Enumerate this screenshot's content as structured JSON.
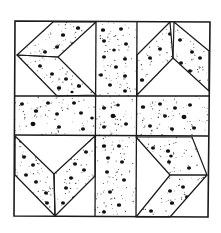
{
  "figure": {
    "width": 221,
    "height": 233,
    "colors": {
      "background": "#ffffff",
      "line": "#1a1a1a",
      "dot": "#111111",
      "speck": "#444444"
    }
  },
  "outer_square": [
    [
      15,
      21
    ],
    [
      210,
      22
    ],
    [
      208,
      217
    ],
    [
      14,
      216
    ]
  ],
  "grid_lines": [
    {
      "name": "vertical-left",
      "points": [
        [
          96,
          21
        ],
        [
          95,
          216
        ]
      ]
    },
    {
      "name": "vertical-right",
      "points": [
        [
          137,
          22
        ],
        [
          136,
          217
        ]
      ]
    },
    {
      "name": "horizontal-top",
      "points": [
        [
          15,
          96
        ],
        [
          209,
          96
        ]
      ]
    },
    {
      "name": "horizontal-bottom",
      "points": [
        [
          14,
          135
        ],
        [
          208,
          136
        ]
      ]
    }
  ],
  "speckled_areas": [
    {
      "name": "center-column-top",
      "points": [
        [
          96,
          21
        ],
        [
          137,
          22
        ],
        [
          137,
          96
        ],
        [
          96,
          96
        ]
      ]
    },
    {
      "name": "center-row",
      "points": [
        [
          15,
          96
        ],
        [
          209,
          96
        ],
        [
          208,
          136
        ],
        [
          14,
          135
        ]
      ]
    },
    {
      "name": "center-column-bottom",
      "points": [
        [
          96,
          135
        ],
        [
          136,
          136
        ],
        [
          136,
          217
        ],
        [
          95,
          216
        ]
      ]
    }
  ],
  "chevron_pieces": [
    {
      "name": "top-left-upper",
      "block": "top-left",
      "points": [
        [
          53,
          22
        ],
        [
          96,
          22
        ],
        [
          58,
          57
        ],
        [
          17,
          55
        ]
      ]
    },
    {
      "name": "top-left-lower",
      "block": "top-left",
      "points": [
        [
          17,
          55
        ],
        [
          58,
          57
        ],
        [
          96,
          95
        ],
        [
          57,
          96
        ]
      ]
    },
    {
      "name": "top-right-left",
      "block": "top-right",
      "points": [
        [
          170,
          22
        ],
        [
          173,
          58
        ],
        [
          137,
          95
        ],
        [
          137,
          55
        ]
      ]
    },
    {
      "name": "top-right-right",
      "block": "top-right",
      "points": [
        [
          174,
          22
        ],
        [
          209,
          51
        ],
        [
          209,
          91
        ],
        [
          173,
          58
        ]
      ]
    },
    {
      "name": "bottom-left-left",
      "block": "bottom-left",
      "points": [
        [
          15,
          136
        ],
        [
          54,
          174
        ],
        [
          55,
          216
        ],
        [
          15,
          175
        ]
      ]
    },
    {
      "name": "bottom-left-right",
      "block": "bottom-left",
      "points": [
        [
          95,
          136
        ],
        [
          95,
          176
        ],
        [
          55,
          216
        ],
        [
          54,
          174
        ]
      ]
    },
    {
      "name": "bottom-right-upper",
      "block": "bottom-right",
      "points": [
        [
          136,
          137
        ],
        [
          192,
          137
        ],
        [
          207,
          175
        ],
        [
          170,
          175
        ]
      ]
    },
    {
      "name": "bottom-right-lower",
      "block": "bottom-right",
      "points": [
        [
          170,
          175
        ],
        [
          207,
          175
        ],
        [
          170,
          217
        ],
        [
          136,
          217
        ]
      ]
    }
  ],
  "dots": [
    [
      63,
      35,
      2.2
    ],
    [
      78,
      28,
      2.2
    ],
    [
      57,
      47,
      2.0
    ],
    [
      73,
      44,
      2.0
    ],
    [
      86,
      33,
      2.0
    ],
    [
      45,
      52,
      2.0
    ],
    [
      69,
      55,
      1.8
    ],
    [
      40,
      66,
      2.0
    ],
    [
      52,
      74,
      2.0
    ],
    [
      66,
      79,
      2.0
    ],
    [
      79,
      86,
      2.2
    ],
    [
      59,
      88,
      2.2
    ],
    [
      72,
      92,
      1.6
    ],
    [
      103,
      30,
      2.2
    ],
    [
      121,
      29,
      2.0
    ],
    [
      104,
      41,
      2.0
    ],
    [
      126,
      44,
      2.0
    ],
    [
      114,
      50,
      1.8
    ],
    [
      104,
      57,
      2.0
    ],
    [
      125,
      59,
      2.0
    ],
    [
      116,
      67,
      2.0
    ],
    [
      101,
      75,
      2.0
    ],
    [
      125,
      76,
      2.0
    ],
    [
      110,
      85,
      2.0
    ],
    [
      125,
      91,
      2.0
    ],
    [
      170,
      34,
      2.0
    ],
    [
      160,
      49,
      2.0
    ],
    [
      150,
      58,
      2.0
    ],
    [
      142,
      80,
      2.2
    ],
    [
      155,
      88,
      2.0
    ],
    [
      180,
      40,
      2.0
    ],
    [
      192,
      52,
      2.0
    ],
    [
      181,
      63,
      2.0
    ],
    [
      200,
      58,
      2.0
    ],
    [
      190,
      71,
      2.0
    ],
    [
      200,
      88,
      2.2
    ],
    [
      36,
      111,
      2.2
    ],
    [
      22,
      104,
      2.0
    ],
    [
      48,
      103,
      2.0
    ],
    [
      57,
      114,
      2.0
    ],
    [
      74,
      103,
      2.0
    ],
    [
      81,
      113,
      2.0
    ],
    [
      92,
      118,
      1.8
    ],
    [
      33,
      124,
      2.5
    ],
    [
      59,
      127,
      2.0
    ],
    [
      83,
      129,
      2.0
    ],
    [
      104,
      108,
      2.0
    ],
    [
      118,
      105,
      1.8
    ],
    [
      113,
      116,
      2.5
    ],
    [
      104,
      127,
      2.0
    ],
    [
      126,
      124,
      2.0
    ],
    [
      143,
      107,
      2.2
    ],
    [
      160,
      104,
      2.0
    ],
    [
      175,
      108,
      2.0
    ],
    [
      190,
      105,
      2.0
    ],
    [
      165,
      116,
      2.0
    ],
    [
      184,
      117,
      2.5
    ],
    [
      150,
      126,
      2.0
    ],
    [
      172,
      129,
      2.0
    ],
    [
      194,
      128,
      2.0
    ],
    [
      21,
      141,
      2.0
    ],
    [
      24,
      157,
      2.0
    ],
    [
      33,
      165,
      2.0
    ],
    [
      26,
      175,
      2.0
    ],
    [
      36,
      182,
      2.0
    ],
    [
      46,
      193,
      2.0
    ],
    [
      47,
      203,
      2.0
    ],
    [
      89,
      140,
      2.0
    ],
    [
      86,
      152,
      2.0
    ],
    [
      75,
      164,
      2.0
    ],
    [
      84,
      170,
      2.0
    ],
    [
      71,
      178,
      2.0
    ],
    [
      66,
      188,
      2.0
    ],
    [
      74,
      198,
      2.0
    ],
    [
      63,
      203,
      2.0
    ],
    [
      104,
      146,
      2.2
    ],
    [
      119,
      146,
      2.0
    ],
    [
      108,
      158,
      2.0
    ],
    [
      122,
      162,
      2.0
    ],
    [
      107,
      172,
      2.0
    ],
    [
      124,
      180,
      2.0
    ],
    [
      110,
      192,
      2.0
    ],
    [
      119,
      205,
      2.2
    ],
    [
      104,
      212,
      2.0
    ],
    [
      153,
      148,
      2.0
    ],
    [
      168,
      151,
      2.2
    ],
    [
      171,
      156,
      1.8
    ],
    [
      169,
      162,
      2.0
    ],
    [
      189,
      168,
      2.0
    ],
    [
      183,
      187,
      2.0
    ],
    [
      170,
      191,
      2.0
    ],
    [
      187,
      197,
      2.0
    ],
    [
      172,
      203,
      2.2
    ],
    [
      151,
      211,
      2.0
    ]
  ],
  "speck_density": 320,
  "speck_seed": 7
}
